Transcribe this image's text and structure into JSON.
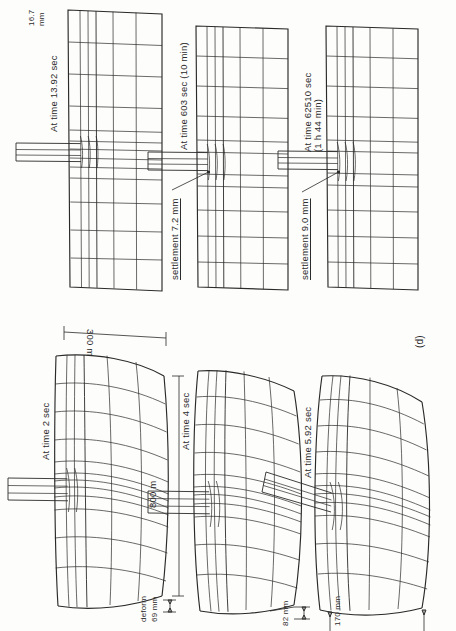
{
  "figure": {
    "caption": "(d)",
    "orientation": "page rotated 90° (landscape plate printed sideways)"
  },
  "panels": [
    {
      "id": "p1",
      "time_label": "At time 2 sec",
      "dim_width_label": "300 m",
      "dim_height_label": "800 m",
      "value_label_line1": "deform",
      "value_label_line2": "69 mm",
      "column": "left",
      "row": 1
    },
    {
      "id": "p2",
      "time_label": "At time 4 sec",
      "value_label": "82 mm",
      "column": "left",
      "row": 2
    },
    {
      "id": "p3",
      "time_label": "At time 5.92 sec",
      "value_label": "170 mm",
      "column": "left",
      "row": 3
    },
    {
      "id": "p4",
      "time_label": "At time 13.92 sec",
      "value_label_line1": "16.7",
      "value_label_line2": "mm",
      "column": "right",
      "row": 1
    },
    {
      "id": "p5",
      "time_label": "At time 603 sec (10 min)",
      "value_label": "settlement 7.2 mm",
      "column": "right",
      "row": 2
    },
    {
      "id": "p6",
      "time_label_line1": "At time 62510 sec",
      "time_label_line2": "(1 h 44 min)",
      "value_label": "settlement 9.0 mm",
      "column": "right",
      "row": 3
    }
  ],
  "colors": {
    "ink": "#2a2a2a",
    "paper": "#fdfdfb"
  }
}
